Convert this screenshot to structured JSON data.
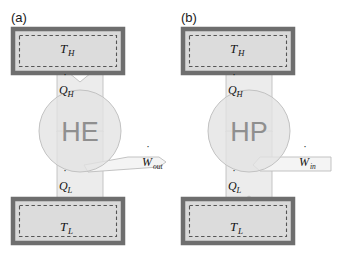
{
  "figure": {
    "width": 339,
    "height": 259,
    "background": "#ffffff"
  },
  "colors": {
    "reservoir_border": "#6e6e6e",
    "reservoir_fill": "#d9d9d9",
    "reservoir_inner_fill": "#dcdcdc",
    "dashed_line": "#5a5a5a",
    "device_circle_fill": "#e3e3e3",
    "device_circle_stroke": "#c2c2c2",
    "device_text": "#8f8f8f",
    "arrow_fill": "#ececec",
    "arrow_stroke": "#b5b5b5",
    "work_arrow_fill": "#f2f2f2",
    "work_arrow_stroke": "#b8b8b8",
    "text": "#141414"
  },
  "panels": [
    {
      "id": "a",
      "label": "(a)",
      "device": {
        "name": "HE",
        "meaning": "heat-engine",
        "cx": 80,
        "cy": 131,
        "r": 41
      },
      "hot_reservoir": {
        "label": "T",
        "subscript": "H",
        "x": 13,
        "y": 29,
        "w": 110,
        "h": 44
      },
      "cold_reservoir": {
        "label": "T",
        "subscript": "L",
        "x": 13,
        "y": 199,
        "w": 110,
        "h": 44
      },
      "heat_in": {
        "label": "Q",
        "subscript": "H",
        "dot": true,
        "direction": "down",
        "from": "device",
        "to": "hot-reservoir"
      },
      "heat_out": {
        "label": "Q",
        "subscript": "L",
        "dot": true,
        "direction": "down",
        "from": "device",
        "to": "cold-reservoir"
      },
      "work": {
        "label": "W",
        "subscript": "out",
        "dot": true,
        "direction": "right",
        "meaning": "work-output"
      }
    },
    {
      "id": "b",
      "label": "(b)",
      "device": {
        "name": "HP",
        "meaning": "heat-pump",
        "cx": 249,
        "cy": 131,
        "r": 41
      },
      "hot_reservoir": {
        "label": "T",
        "subscript": "H",
        "x": 183,
        "y": 29,
        "w": 110,
        "h": 44
      },
      "cold_reservoir": {
        "label": "T",
        "subscript": "L",
        "x": 183,
        "y": 199,
        "w": 110,
        "h": 44
      },
      "heat_in": {
        "label": "Q",
        "subscript": "H",
        "dot": true,
        "direction": "up",
        "from": "device",
        "to": "hot-reservoir"
      },
      "heat_out": {
        "label": "Q",
        "subscript": "L",
        "dot": true,
        "direction": "up",
        "from": "cold-reservoir",
        "to": "device"
      },
      "work": {
        "label": "W",
        "subscript": "in",
        "dot": true,
        "direction": "left",
        "meaning": "work-input"
      }
    }
  ]
}
